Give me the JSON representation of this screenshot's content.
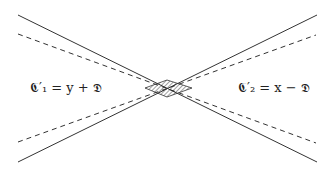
{
  "diagram": {
    "labels": {
      "left": "𝕮′₁ = y + 𝕯",
      "right": "𝕮′₂ = x − 𝕯"
    },
    "colors": {
      "line": "#333333",
      "hatch": "#444444",
      "background": "#ffffff"
    },
    "lines": [
      {
        "style": "solid",
        "from": [
          18,
          15
        ],
        "to": [
          317,
          162
        ]
      },
      {
        "style": "solid",
        "from": [
          18,
          162
        ],
        "to": [
          317,
          15
        ]
      },
      {
        "style": "dashed",
        "from": [
          18,
          34
        ],
        "to": [
          316,
          143
        ]
      },
      {
        "style": "dashed",
        "from": [
          18,
          142
        ],
        "to": [
          316,
          35
        ]
      }
    ],
    "shaded_region": {
      "shape": "diamond",
      "fill": "hatched",
      "vertices": [
        [
          145,
          88
        ],
        [
          167,
          80
        ],
        [
          192,
          88
        ],
        [
          167,
          97
        ]
      ]
    }
  }
}
